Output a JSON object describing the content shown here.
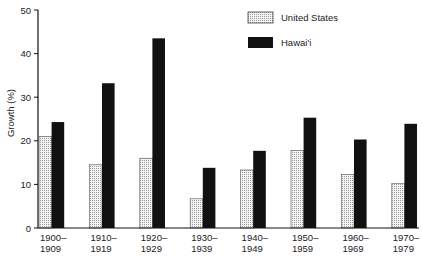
{
  "chart_data": {
    "type": "bar",
    "title": "",
    "xlabel": "",
    "ylabel": "Growth (%)",
    "ylim": [
      0,
      50
    ],
    "yticks": [
      0,
      10,
      20,
      30,
      40,
      50
    ],
    "grid": false,
    "legend_position": "top-right",
    "categories": [
      [
        "1900–",
        "1909"
      ],
      [
        "1910–",
        "1919"
      ],
      [
        "1920–",
        "1929"
      ],
      [
        "1930–",
        "1939"
      ],
      [
        "1940–",
        "1949"
      ],
      [
        "1950–",
        "1959"
      ],
      [
        "1960–",
        "1969"
      ],
      [
        "1970–",
        "1979"
      ]
    ],
    "series": [
      {
        "name": "United States",
        "pattern": "dotted-light",
        "color": "#e8e8e8",
        "values": [
          21.0,
          14.5,
          16.0,
          6.7,
          13.3,
          17.8,
          12.3,
          10.2
        ]
      },
      {
        "name": "Hawai'i",
        "pattern": "solid",
        "color": "#111111",
        "values": [
          24.3,
          33.2,
          43.5,
          13.8,
          17.7,
          25.3,
          20.3,
          23.9
        ]
      }
    ]
  },
  "legend": {
    "items": [
      {
        "label": "United States"
      },
      {
        "label": "Hawai'i"
      }
    ]
  }
}
